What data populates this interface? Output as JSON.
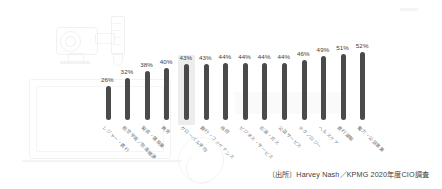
{
  "chart_data": {
    "type": "bar",
    "title": "",
    "subtitle": "",
    "xlabel": "",
    "ylabel": "",
    "ylim": [
      0,
      60
    ],
    "grid": false,
    "legend": null,
    "orientation": "vertical",
    "value_suffix": "%",
    "highlighted_index": 4,
    "categories": [
      "レジャー・旅行",
      "航空宇宙／防衛関連",
      "製造・建設業",
      "教育",
      "グローバル平均",
      "銀行・ファイナンス",
      "政府",
      "ビジネス・サービス",
      "石油・ガス",
      "公益サービス",
      "テクノロジー",
      "ヘルスケア",
      "旅行運輸",
      "電力・公益事業"
    ],
    "values": [
      26,
      32,
      38,
      40,
      43,
      43,
      44,
      44,
      44,
      44,
      46,
      49,
      51,
      52
    ],
    "data_labels": [
      "26%",
      "32%",
      "38%",
      "40%",
      "43%",
      "43%",
      "44%",
      "44%",
      "44%",
      "44%",
      "46%",
      "49%",
      "51%",
      "52%"
    ],
    "annotations": [
      "〔出所〕Harvey Nash／KPMG 2020年度CIO調査"
    ],
    "colors": {
      "bar": "#4a4a4a",
      "highlight_band": "#ededed",
      "value_text": "#3d3d3d",
      "category_text": "#6e6e6e",
      "background": "#ffffff",
      "watermark": "#f2f2f2"
    }
  },
  "source_note": "〔出所〕Harvey Nash／KPMG 2020年度CIO調査"
}
